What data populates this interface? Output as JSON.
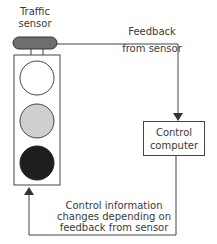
{
  "diagram": {
    "sensor": {
      "label_line1": "Traffic",
      "label_line2": "sensor",
      "color": "#6e6e6e"
    },
    "traffic_light": {
      "lights": [
        {
          "name": "top",
          "fill": "#ffffff"
        },
        {
          "name": "middle",
          "fill": "#cfcfcf"
        },
        {
          "name": "bottom",
          "fill": "#1e1e1e"
        }
      ]
    },
    "feedback_label": {
      "line1": "Feedback",
      "line2": "from sensor"
    },
    "control_computer": {
      "line1": "Control",
      "line2": "computer"
    },
    "control_info_label": {
      "line1": "Control information",
      "line2": "changes depending on",
      "line3": "feedback from sensor"
    },
    "line_color": "#444444"
  }
}
